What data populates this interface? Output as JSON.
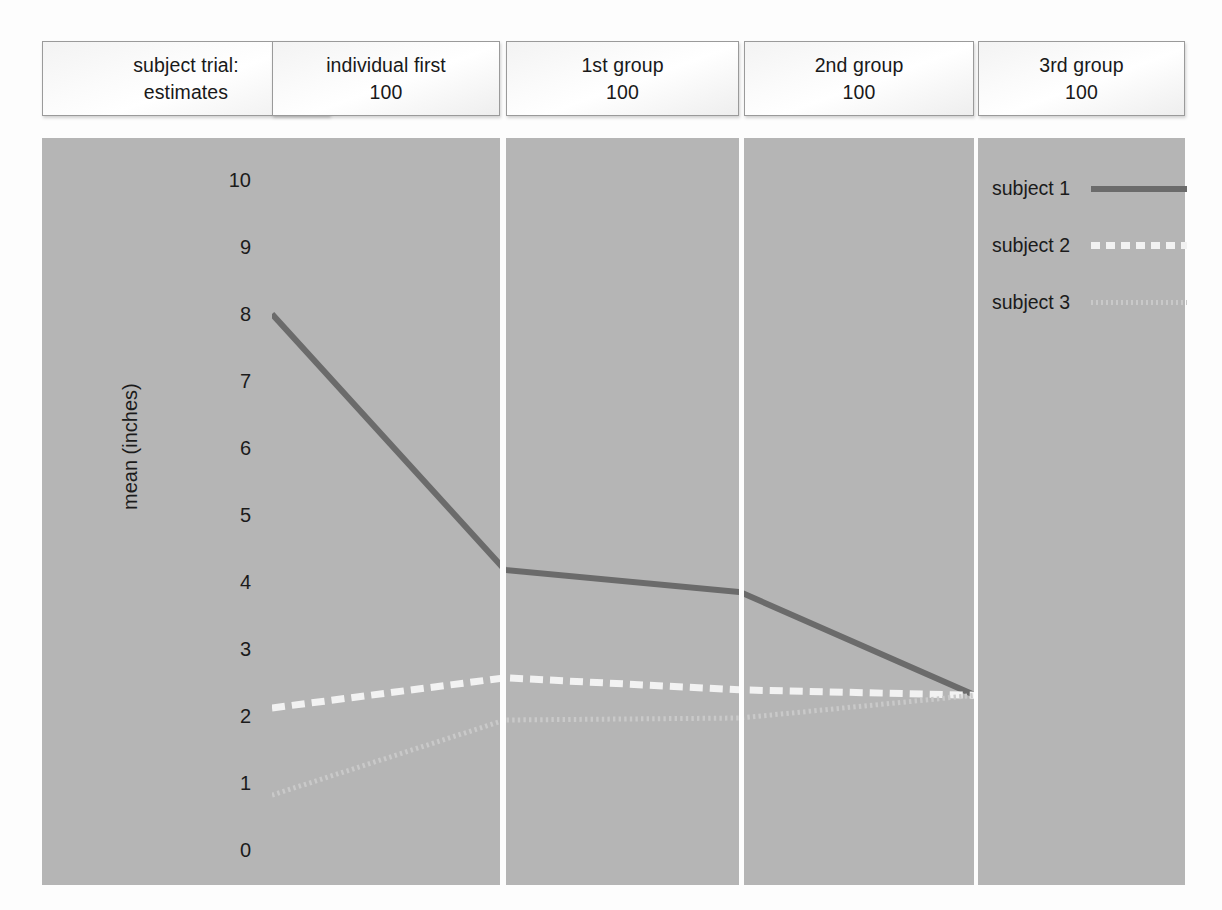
{
  "chart_data": {
    "type": "line",
    "title": "",
    "xlabel": "",
    "ylabel": "mean (inches)",
    "ylim": [
      0,
      10
    ],
    "grid": false,
    "legend_position": "top-right-panel",
    "categories": [
      "individual first 100",
      "1st group 100",
      "2nd group 100",
      "3rd group 100"
    ],
    "panel_headers": [
      {
        "line1": "subject trial:",
        "line2": "estimates"
      },
      {
        "line1": "individual first",
        "line2": "100"
      },
      {
        "line1": "1st group",
        "line2": "100"
      },
      {
        "line1": "2nd group",
        "line2": "100"
      },
      {
        "line1": "3rd group",
        "line2": "100"
      }
    ],
    "yticks": [
      "10",
      "9",
      "8",
      "7",
      "6",
      "5",
      "4",
      "3",
      "2",
      "1",
      "0"
    ],
    "series": [
      {
        "name": "subject 1",
        "style": "solid",
        "color": "#6b6b6b",
        "values": [
          8.0,
          4.18,
          3.85,
          2.31
        ]
      },
      {
        "name": "subject 2",
        "style": "dashed",
        "color": "#f2f2f2",
        "values": [
          2.12,
          2.57,
          2.39,
          2.31
        ]
      },
      {
        "name": "subject 3",
        "style": "dotted",
        "color": "#c9c9c9",
        "values": [
          0.82,
          1.94,
          1.97,
          2.31
        ]
      }
    ]
  },
  "legend": {
    "items": [
      {
        "label": "subject 1"
      },
      {
        "label": "subject 2"
      },
      {
        "label": "subject 3"
      }
    ]
  },
  "colors": {
    "panel_background": "#b5b5b5",
    "page_background": "#fdfdfd",
    "series_1": "#6b6b6b",
    "series_2": "#f2f2f2",
    "series_3": "#c9c9c9",
    "text": "#1b1b1b"
  }
}
